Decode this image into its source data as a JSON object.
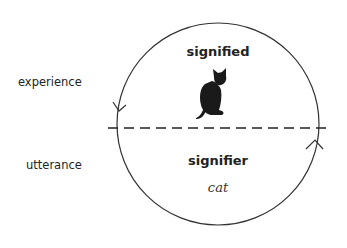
{
  "diagram": {
    "left_labels": {
      "top": "experience",
      "bottom": "utterance"
    },
    "upper_half": {
      "title": "signified",
      "image": "black-cat"
    },
    "lower_half": {
      "title": "signifier",
      "word": "cat"
    },
    "circle": {
      "cx": 218,
      "cy": 124,
      "r": 101,
      "stroke": "#333333"
    },
    "divider": {
      "style": "dashed",
      "y": 128,
      "x_start": 108,
      "x_end": 330
    },
    "arrows": [
      {
        "position": "left",
        "direction": "down"
      },
      {
        "position": "right",
        "direction": "up"
      }
    ]
  }
}
